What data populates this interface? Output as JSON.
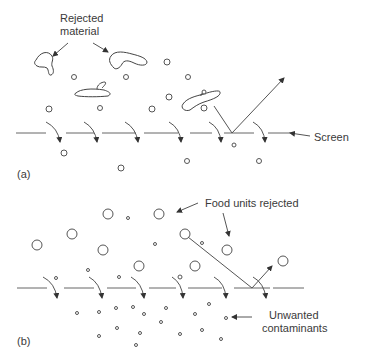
{
  "panel_a": {
    "label": "(a)",
    "callouts": {
      "rejected_material_line1": "Rejected",
      "rejected_material_line2": "material",
      "screen": "Screen"
    }
  },
  "panel_b": {
    "label": "(b)",
    "callouts": {
      "food_units_rejected": "Food units rejected",
      "unwanted_contaminants_line1": "Unwanted",
      "unwanted_contaminants_line2": "contaminants"
    }
  },
  "colors": {
    "line": "#555555",
    "text": "#3a3a3a",
    "background": "#ffffff"
  }
}
